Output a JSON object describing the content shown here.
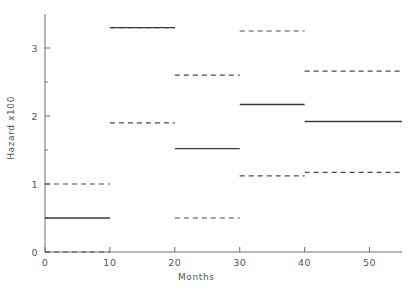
{
  "chart_data": {
    "type": "line",
    "title": "",
    "xlabel": "Months",
    "ylabel": "Hazard x100",
    "xlim": [
      0,
      55
    ],
    "ylim": [
      0,
      3.5
    ],
    "xticks": [
      0,
      10,
      20,
      30,
      40,
      50
    ],
    "xtick_labels": [
      "0",
      "10",
      "20",
      "30",
      "40",
      "50"
    ],
    "yticks": [
      0,
      1,
      2,
      3
    ],
    "ytick_labels": [
      "0",
      "1",
      "2",
      "3"
    ],
    "yminorticks": [
      0.5,
      1.5,
      2.5
    ],
    "grid": false,
    "legend": null,
    "step_edges": [
      0,
      10,
      20,
      30,
      40,
      55
    ],
    "series": [
      {
        "name": "upper-confidence-bound",
        "style": "dashed",
        "values": [
          1.0,
          3.3,
          2.6,
          3.25,
          2.66
        ]
      },
      {
        "name": "hazard-estimate",
        "style": "solid",
        "values": [
          0.5,
          3.3,
          1.52,
          2.17,
          1.92
        ]
      },
      {
        "name": "lower-confidence-bound",
        "style": "dashed",
        "values": [
          0.0,
          1.9,
          0.5,
          1.12,
          1.17
        ]
      }
    ]
  },
  "colors": {
    "axis": "#6f6f6f",
    "solid_line": "#3a3a3a",
    "dashed_line": "#4a4a4a",
    "background": "#ffffff",
    "text": "#555555"
  }
}
